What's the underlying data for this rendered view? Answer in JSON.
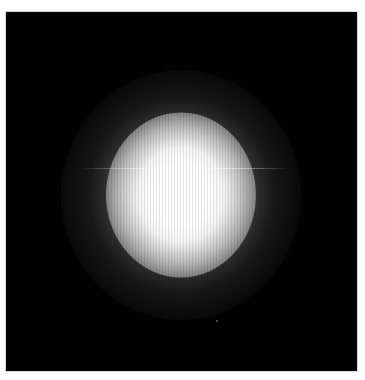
{
  "image": {
    "description": "Glowing white light spot centered on a black background",
    "background_color": "#020202",
    "border_color": "#ffffff",
    "spot_color": "#ffffff",
    "spot_center": [
      181,
      195
    ],
    "core_size": [
      66,
      76
    ],
    "glow_radius": 120,
    "streak": {
      "y": 168,
      "x_start": 80,
      "x_end": 290
    }
  }
}
